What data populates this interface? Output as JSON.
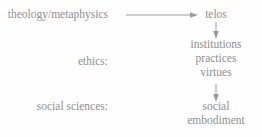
{
  "diagram": {
    "text_color": "#8f8f8f",
    "background_color": "#fefefe",
    "arrow_color": "#9a9a9a",
    "left_column": [
      {
        "id": "theology",
        "label": "theology/metaphysics"
      },
      {
        "id": "ethics",
        "label": "ethics:"
      },
      {
        "id": "social_sciences",
        "label": "social sciences:"
      }
    ],
    "right_column": [
      {
        "id": "telos",
        "label": "telos"
      },
      {
        "id": "institutions",
        "label": "institutions"
      },
      {
        "id": "practices",
        "label": "practices"
      },
      {
        "id": "virtues",
        "label": "virtues"
      },
      {
        "id": "social",
        "label": "social"
      },
      {
        "id": "embodiment",
        "label": "embodiment"
      }
    ],
    "arrows": [
      {
        "id": "horizontal",
        "from": "theology/metaphysics",
        "to": "telos",
        "direction": "right"
      },
      {
        "id": "vertical-1",
        "from": "telos",
        "to": "institutions",
        "direction": "down"
      },
      {
        "id": "vertical-2",
        "from": "virtues",
        "to": "social embodiment",
        "direction": "down"
      }
    ]
  }
}
